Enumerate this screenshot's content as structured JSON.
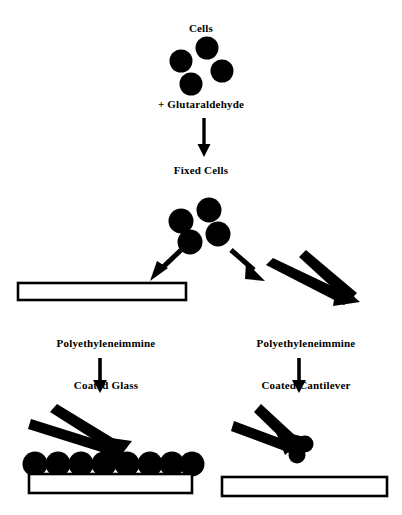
{
  "figure": {
    "type": "process-flow-diagram",
    "background_color": "#ffffff",
    "ink_color": "#000000"
  },
  "labels": {
    "cells": "Cells",
    "glutaraldehyde": "+ Glutaraldehyde",
    "fixed_cells": "Fixed Cells",
    "coated_glass_line1": "Polyethyleneimmine",
    "coated_glass_line2": "Coated Glass",
    "coated_cantilever_line1": "Polyethyleneimmine",
    "coated_cantilever_line2": "Coated Cantilever"
  },
  "steps": [
    {
      "id": "cells",
      "label": "Cells",
      "cell_count": 4
    },
    {
      "id": "glutaraldehyde",
      "label": "+ Glutaraldehyde"
    },
    {
      "id": "fixed-cells",
      "label": "Fixed Cells",
      "cell_count": 4
    },
    {
      "id": "coated-glass",
      "label": "Polyethyleneimmine Coated Glass"
    },
    {
      "id": "coated-cantilever",
      "label": "Polyethyleneimmine Coated Cantilever"
    },
    {
      "id": "cells-on-glass",
      "cell_count": 8
    },
    {
      "id": "cells-on-cantilever",
      "cell_count": 3
    }
  ],
  "shapes": {
    "cells_top": [
      {
        "cx": 207,
        "cy": 48,
        "r": 11
      },
      {
        "cx": 181,
        "cy": 61,
        "r": 11
      },
      {
        "cx": 222,
        "cy": 71,
        "r": 11
      },
      {
        "cx": 191,
        "cy": 84,
        "r": 11
      }
    ],
    "cells_fixed": [
      {
        "cx": 209,
        "cy": 210,
        "r": 12
      },
      {
        "cx": 181,
        "cy": 221,
        "r": 12
      },
      {
        "cx": 218,
        "cy": 234,
        "r": 12
      },
      {
        "cx": 190,
        "cy": 242,
        "r": 12
      }
    ],
    "cells_on_glass": [
      {
        "cx": 35,
        "cy": 464,
        "r": 12
      },
      {
        "cx": 58,
        "cy": 464,
        "r": 12
      },
      {
        "cx": 81,
        "cy": 464,
        "r": 12
      },
      {
        "cx": 104,
        "cy": 464,
        "r": 12
      },
      {
        "cx": 127,
        "cy": 464,
        "r": 12
      },
      {
        "cx": 150,
        "cy": 464,
        "r": 12
      },
      {
        "cx": 173,
        "cy": 464,
        "r": 12
      },
      {
        "cx": 194,
        "cy": 464,
        "r": 12
      }
    ],
    "cells_on_cantilever": [
      {
        "cx": 289,
        "cy": 443,
        "r": 9
      },
      {
        "cx": 305,
        "cy": 444,
        "r": 8
      },
      {
        "cx": 297,
        "cy": 455,
        "r": 8
      }
    ],
    "slide_top_left": {
      "x": 18,
      "y": 283,
      "w": 168,
      "h": 17
    },
    "slide_bottom_left": {
      "x": 29,
      "y": 474,
      "w": 163,
      "h": 19
    },
    "slide_bottom_right": {
      "x": 222,
      "y": 477,
      "w": 165,
      "h": 19
    }
  },
  "arrows": {
    "glutaraldehyde_down": {
      "x": 204,
      "y1": 118,
      "y2": 152
    },
    "branch_left": {
      "x1": 183,
      "y1": 247,
      "x2": 152,
      "y2": 277
    },
    "branch_right": {
      "x1": 229,
      "y1": 247,
      "x2": 262,
      "y2": 277
    },
    "glass_down": {
      "x": 100,
      "y1": 358,
      "y2": 392
    },
    "cantilever_down": {
      "x": 299,
      "y1": 358,
      "y2": 392
    }
  }
}
